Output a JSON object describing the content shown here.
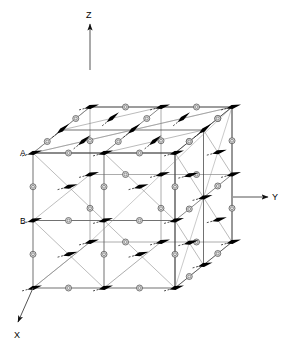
{
  "figure": {
    "type": "crystal-lattice-magnetic-structure",
    "background_color": "#ffffff",
    "line_color": "#333333",
    "arrow_color": "#000000",
    "atom_fill": "#e8e8e8",
    "atom_stroke": "#555555"
  },
  "axes": {
    "z": {
      "label": "Z",
      "direction": "up"
    },
    "y": {
      "label": "Y",
      "direction": "right"
    },
    "x": {
      "label": "X",
      "direction": "down-left"
    }
  },
  "site_labels": [
    {
      "name": "A",
      "text": "A"
    },
    {
      "name": "B",
      "text": "B"
    }
  ],
  "geometry": {
    "cube_divisions": 2,
    "origin_front_top_left": [
      33,
      153
    ],
    "edge_right_px": [
      142,
      0
    ],
    "edge_down_px": [
      0,
      135
    ],
    "edge_depth_px": [
      57,
      -46
    ]
  },
  "spin_arrows": {
    "count": 54,
    "description": "ferromagnetic spin vectors at lattice vertices and cell centers",
    "tail_style": "dashed"
  },
  "atoms": {
    "count": 48,
    "description": "open circles at edge midpoints"
  }
}
